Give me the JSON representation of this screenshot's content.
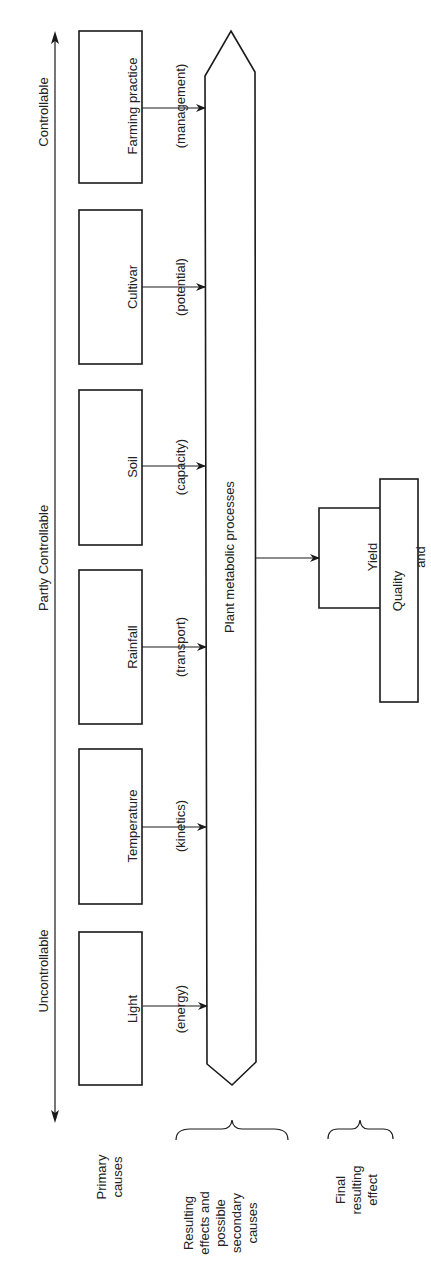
{
  "axis": {
    "labels": [
      "Uncontrollable",
      "Partly Controllable",
      "Controllable"
    ]
  },
  "primary_causes": [
    {
      "name": "Light",
      "detail": "(energy)"
    },
    {
      "name": "Temperature",
      "detail": "(kinetics)"
    },
    {
      "name": "Rainfall",
      "detail": "(transport)"
    },
    {
      "name": "Soil",
      "detail": "(capacity)"
    },
    {
      "name": "Cultivar",
      "detail": "(potential)"
    },
    {
      "name": "Farming practice",
      "detail": "(management)"
    }
  ],
  "process": {
    "label": "Plant metabolic processes"
  },
  "outcome": {
    "line1": "Yield",
    "line2": "and",
    "line3": "Quality"
  },
  "legend": {
    "primary": "Primary\ncauses",
    "secondary": "Resulting\neffects and\npossible\nsecondary\ncauses",
    "final": "Final\nresulting\neffect"
  },
  "colors": {
    "stroke": "#1a1a1a",
    "background": "#ffffff"
  }
}
